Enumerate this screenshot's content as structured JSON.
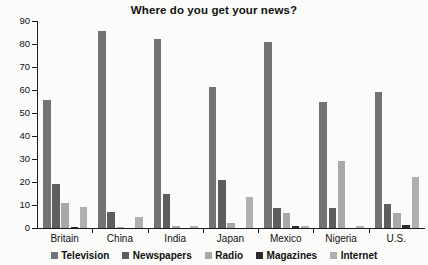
{
  "chart_data": {
    "type": "bar",
    "title": "Where do you get your news?",
    "xlabel": "",
    "ylabel": "",
    "ylim": [
      0,
      90
    ],
    "yticks": [
      0,
      10,
      20,
      30,
      40,
      50,
      60,
      70,
      80,
      90
    ],
    "grid": false,
    "legend_position": "bottom",
    "categories": [
      "Britain",
      "China",
      "India",
      "Japan",
      "Mexico",
      "Nigeria",
      "U.S."
    ],
    "series": [
      {
        "name": "Television",
        "color": "#737373",
        "values": [
          55.5,
          85.5,
          82,
          61.5,
          81,
          55,
          59
        ]
      },
      {
        "name": "Newspapers",
        "color": "#5e5e5e",
        "values": [
          19,
          7,
          15,
          21,
          8.5,
          8.5,
          10.5
        ]
      },
      {
        "name": "Radio",
        "color": "#a8a8a8",
        "values": [
          11,
          0.5,
          1,
          2,
          6.5,
          29,
          6.5
        ]
      },
      {
        "name": "Magazines",
        "color": "#2b2b2b",
        "values": [
          0.5,
          0,
          0,
          0,
          1,
          0,
          1.5
        ]
      },
      {
        "name": "Internet",
        "color": "#b0b0b0",
        "values": [
          9,
          5,
          1,
          13.5,
          1,
          1,
          22
        ]
      }
    ]
  }
}
